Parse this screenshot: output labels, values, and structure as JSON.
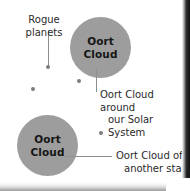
{
  "diagram": {
    "background_color": "#ffffff",
    "cloud_color": "#9d9d9d",
    "line_color": "#8e8e8e",
    "text_color": "#2a2a2a",
    "clouds": [
      {
        "id": "solar",
        "label_line1": "Oort",
        "label_line2": "Cloud"
      },
      {
        "id": "other",
        "label_line1": "Oort",
        "label_line2": "Cloud"
      }
    ],
    "labels": {
      "rogue_planets_line1": "Rogue",
      "rogue_planets_line2": "planets",
      "solar_caption_line1": "Oort Cloud around",
      "solar_caption_line2": "our Solar System",
      "other_caption_line1": "Oort Cloud of",
      "other_caption_line2": "another star"
    }
  }
}
